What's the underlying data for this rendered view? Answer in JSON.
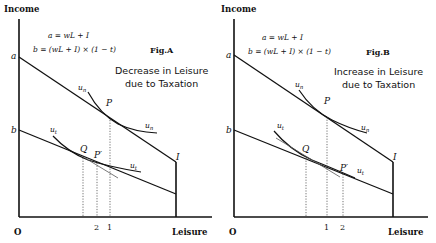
{
  "panels": [
    {
      "id": "A",
      "y_axis_label": "Income",
      "x_axis_label": "Leisure",
      "origin_label": "O",
      "eq_a": "a = wL + I",
      "eq_b": "b = (wL + I) × (1 − t)",
      "fig_label": "Fig.A",
      "caption_line1": "Decrease in Leisure",
      "caption_line2": "due to Taxation",
      "labels": {
        "a": "a",
        "b": "b",
        "I": "I",
        "P": "P",
        "Q": "Q",
        "Pprime": "P′",
        "un_top": "un",
        "un_right": "un",
        "ut_left": "ut",
        "ut_right": "ut"
      },
      "ticks": [
        "2",
        "1"
      ]
    },
    {
      "id": "B",
      "y_axis_label": "Income",
      "x_axis_label": "Leisure",
      "origin_label": "O",
      "eq_a": "a = wL + I",
      "eq_b": "b = (wL + I) × (1 − t)",
      "fig_label": "Fig.B",
      "caption_line1": "Increase in Leisure",
      "caption_line2": "due to Taxation",
      "labels": {
        "a": "a",
        "b": "b",
        "I": "I",
        "P": "P",
        "Q": "Q",
        "Pprime": "P′",
        "un_top": "un",
        "un_right": "un",
        "ut_left": "ut",
        "ut_right": "ut"
      },
      "ticks": [
        "1",
        "2"
      ]
    }
  ]
}
